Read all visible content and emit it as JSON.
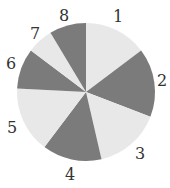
{
  "diagram": {
    "type": "spinner",
    "center": [
      86,
      92
    ],
    "radius": 69,
    "colors": {
      "light": "#e8e8e8",
      "dark": "#7b7b7b",
      "label": "#333333"
    },
    "sectors": [
      {
        "label": "1",
        "start": 0,
        "end": 53,
        "shade": "light",
        "label_pos": [
          118,
          16
        ]
      },
      {
        "label": "2",
        "start": 53,
        "end": 111,
        "shade": "dark",
        "label_pos": [
          162,
          80
        ]
      },
      {
        "label": "3",
        "start": 111,
        "end": 167,
        "shade": "light",
        "label_pos": [
          140,
          153
        ]
      },
      {
        "label": "4",
        "start": 167,
        "end": 217,
        "shade": "dark",
        "label_pos": [
          70,
          174
        ]
      },
      {
        "label": "5",
        "start": 217,
        "end": 273,
        "shade": "light",
        "label_pos": [
          12,
          127
        ]
      },
      {
        "label": "6",
        "start": 273,
        "end": 307,
        "shade": "dark",
        "label_pos": [
          11,
          63
        ]
      },
      {
        "label": "7",
        "start": 307,
        "end": 329,
        "shade": "light",
        "label_pos": [
          35,
          33
        ]
      },
      {
        "label": "8",
        "start": 329,
        "end": 360,
        "shade": "dark",
        "label_pos": [
          64,
          15
        ]
      }
    ]
  }
}
